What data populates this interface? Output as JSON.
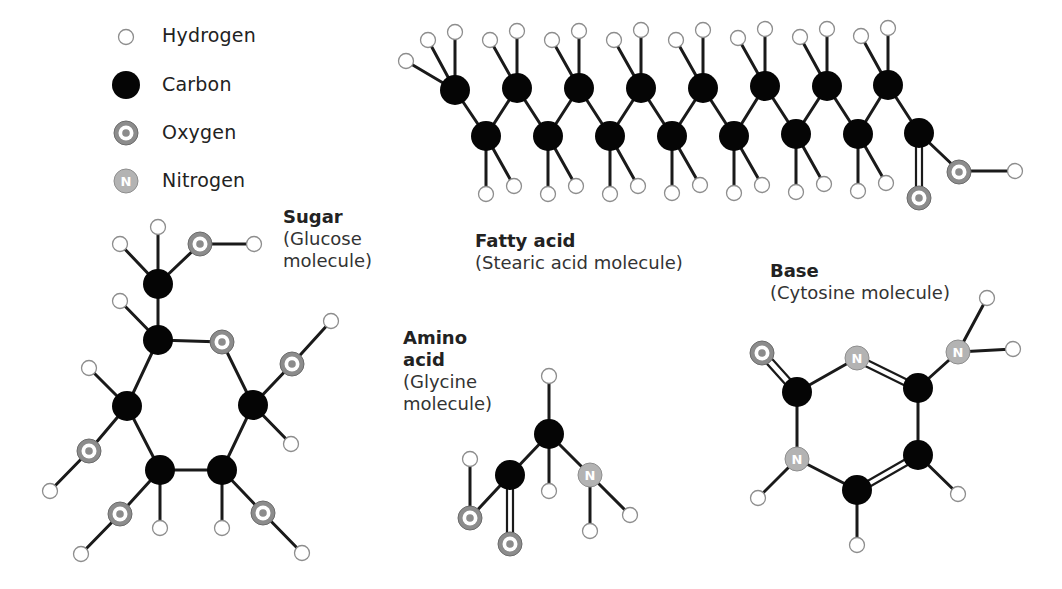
{
  "legend": {
    "items": [
      {
        "atom": "hydrogen",
        "label": "Hydrogen",
        "icon": "hydrogen-atom-icon",
        "color": "#ffffff"
      },
      {
        "atom": "carbon",
        "label": "Carbon",
        "icon": "carbon-atom-icon",
        "color": "#050505"
      },
      {
        "atom": "oxygen",
        "label": "Oxygen",
        "icon": "oxygen-atom-icon",
        "color": "#8c8c8c"
      },
      {
        "atom": "nitrogen",
        "label": "Nitrogen",
        "icon": "nitrogen-atom-icon",
        "color": "#b3b3b3",
        "glyph": "N"
      }
    ]
  },
  "molecules": {
    "sugar": {
      "title": "Sugar",
      "subtitle_line1": "(Glucose",
      "subtitle_line2": "molecule)"
    },
    "fatty_acid": {
      "title": "Fatty acid",
      "subtitle": "(Stearic acid molecule)"
    },
    "amino_acid": {
      "title_line1": "Amino",
      "title_line2": "acid",
      "subtitle_line1": "(Glycine",
      "subtitle_line2": "molecule)"
    },
    "base": {
      "title": "Base",
      "subtitle": "(Cytosine molecule)"
    }
  },
  "atom_glyphs": {
    "nitrogen": "N"
  }
}
